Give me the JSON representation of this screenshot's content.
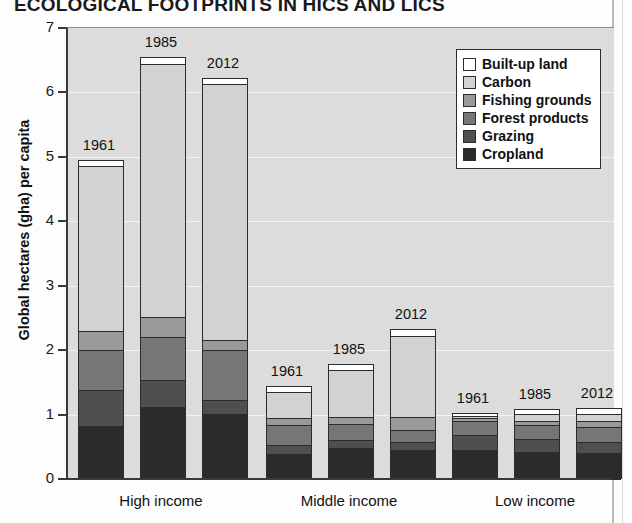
{
  "title": "ECOLOGICAL FOOTPRINTS IN HICS AND LICS",
  "chart_data": {
    "type": "bar",
    "subtype": "stacked-bar-grouped",
    "title": "ECOLOGICAL FOOTPRINTS IN HICS AND LICS",
    "xlabel": "",
    "ylabel": "Global hectares (gha) per capita",
    "ylim": [
      0,
      7
    ],
    "yticks": [
      "0",
      "1",
      "2",
      "3",
      "4",
      "5",
      "6",
      "7"
    ],
    "grid": "horizontal",
    "legend_position": "top-right",
    "groups": [
      "High income",
      "Middle income",
      "Low income"
    ],
    "years": [
      "1961",
      "1985",
      "2012"
    ],
    "categories": [
      "High income 1961",
      "High income 1985",
      "High income 2012",
      "Middle income 1961",
      "Middle income 1985",
      "Middle income 2012",
      "Low income 1961",
      "Low income 1985",
      "Low income 2012"
    ],
    "series": [
      {
        "name": "Cropland",
        "color": "#2b2b2b",
        "values": [
          0.84,
          1.13,
          1.02,
          0.41,
          0.5,
          0.47,
          0.47,
          0.43,
          0.42
        ]
      },
      {
        "name": "Grazing",
        "color": "#4f4f4f",
        "values": [
          0.55,
          0.42,
          0.22,
          0.13,
          0.12,
          0.12,
          0.23,
          0.2,
          0.17
        ]
      },
      {
        "name": "Forest products",
        "color": "#767676",
        "values": [
          0.62,
          0.67,
          0.77,
          0.31,
          0.25,
          0.19,
          0.22,
          0.22,
          0.24
        ]
      },
      {
        "name": "Fishing grounds",
        "color": "#9a9a9a",
        "values": [
          0.31,
          0.31,
          0.16,
          0.12,
          0.11,
          0.2,
          0.05,
          0.06,
          0.08
        ]
      },
      {
        "name": "Carbon",
        "color": "#d2d2d2",
        "values": [
          2.56,
          3.92,
          3.98,
          0.4,
          0.72,
          1.26,
          0.03,
          0.11,
          0.12
        ]
      },
      {
        "name": "Built-up land",
        "color": "#ffffff",
        "values": [
          0.07,
          0.1,
          0.07,
          0.08,
          0.08,
          0.09,
          0.02,
          0.07,
          0.07
        ]
      }
    ],
    "totals": [
      4.95,
      6.55,
      6.22,
      1.45,
      1.78,
      2.33,
      1.02,
      1.09,
      1.1
    ],
    "bar_labels": [
      "1961",
      "1985",
      "2012",
      "1961",
      "1985",
      "2012",
      "1961",
      "1985",
      "2012"
    ]
  },
  "legend": {
    "items": [
      {
        "label": "Built-up land",
        "color": "#ffffff"
      },
      {
        "label": "Carbon",
        "color": "#d2d2d2"
      },
      {
        "label": "Fishing grounds",
        "color": "#9a9a9a"
      },
      {
        "label": "Forest products",
        "color": "#767676"
      },
      {
        "label": "Grazing",
        "color": "#4f4f4f"
      },
      {
        "label": "Cropland",
        "color": "#2b2b2b"
      }
    ]
  },
  "colors": {
    "plot_background": "#dcdcdc",
    "gridline": "#f2f2f2",
    "axis": "#3a3a3a",
    "bar_outline": "#2c2c2c"
  }
}
